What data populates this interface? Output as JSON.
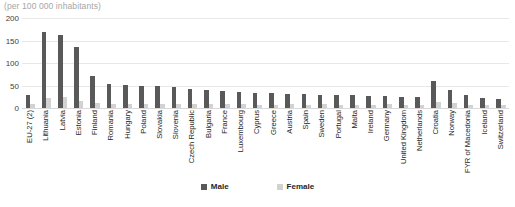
{
  "subtitle": "(per 100 000 inhabitants)",
  "legend": {
    "male_label": "Male",
    "female_label": "Female"
  },
  "colors": {
    "male": "#595959",
    "female": "#d2d2d2",
    "grid": "#e8e8e8",
    "text": "#262626",
    "subtitle": "#a6a6a6"
  },
  "chart_data": {
    "type": "bar",
    "title": "",
    "subtitle": "(per 100 000 inhabitants)",
    "xlabel": "",
    "ylabel": "",
    "ylim": [
      0,
      200
    ],
    "yticks": [
      0,
      50,
      100,
      150,
      200
    ],
    "grid": true,
    "legend_position": "bottom",
    "categories": [
      "EU-27 (2)",
      "Lithuania",
      "Latvia",
      "Estonia",
      "Finland",
      "Romania",
      "Hungary",
      "Poland",
      "Slovakia",
      "Slovenia",
      "Czech Republic",
      "Bulgaria",
      "France",
      "Luxembourg",
      "Cyprus",
      "Greece",
      "Austria",
      "Spain",
      "Sweden",
      "Portugal",
      "Malta",
      "Ireland",
      "Germany",
      "United Kingdom",
      "Netherlands",
      "Croatia",
      "Norway",
      "FYR of Macedonia",
      "Iceland",
      "Switzerland"
    ],
    "series": [
      {
        "name": "Male",
        "color": "#595959",
        "values": [
          28,
          170,
          163,
          135,
          72,
          54,
          52,
          50,
          48,
          46,
          42,
          40,
          38,
          36,
          34,
          33,
          32,
          31,
          30,
          29,
          28,
          27,
          26,
          25,
          24,
          60,
          40,
          28,
          22,
          20
        ]
      },
      {
        "name": "Female",
        "color": "#d2d2d2",
        "values": [
          8,
          22,
          24,
          16,
          12,
          10,
          9,
          9,
          8,
          8,
          8,
          8,
          9,
          8,
          7,
          7,
          8,
          7,
          10,
          7,
          6,
          6,
          8,
          6,
          7,
          14,
          12,
          6,
          6,
          6
        ]
      }
    ]
  }
}
